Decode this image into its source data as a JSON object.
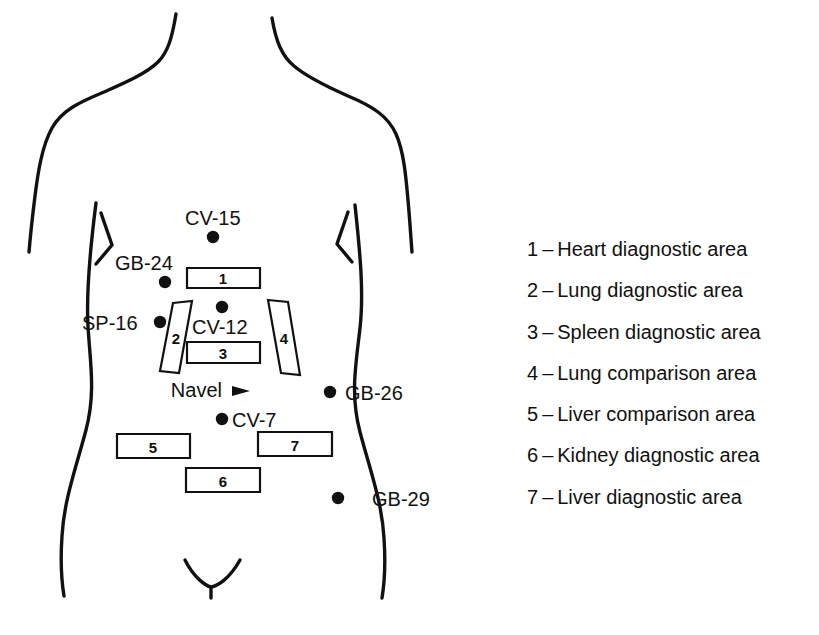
{
  "figure": {
    "line_color": "#111111",
    "background_color": "#ffffff"
  },
  "body_map": {
    "acupoints": [
      {
        "id": "cv-15",
        "label": "CV-15",
        "dot_x": 213,
        "dot_y": 237,
        "label_x": 185,
        "label_y": 225,
        "anchor": "start"
      },
      {
        "id": "gb-24",
        "label": "GB-24",
        "dot_x": 165,
        "dot_y": 282,
        "label_x": 115,
        "label_y": 270,
        "anchor": "start"
      },
      {
        "id": "sp-16",
        "label": "SP-16",
        "dot_x": 160,
        "dot_y": 322,
        "label_x": 82,
        "label_y": 330,
        "anchor": "start"
      },
      {
        "id": "cv-12",
        "label": "CV-12",
        "dot_x": 222,
        "dot_y": 307,
        "label_x": 192,
        "label_y": 334,
        "anchor": "start"
      },
      {
        "id": "gb-26",
        "label": "GB-26",
        "dot_x": 330,
        "dot_y": 392,
        "label_x": 345,
        "label_y": 400,
        "anchor": "start"
      },
      {
        "id": "cv-7",
        "label": "CV-7",
        "dot_x": 222,
        "dot_y": 419,
        "label_x": 232,
        "label_y": 427,
        "anchor": "start"
      },
      {
        "id": "gb-29",
        "label": "GB-29",
        "dot_x": 338,
        "dot_y": 498,
        "label_x": 372,
        "label_y": 506,
        "anchor": "start"
      }
    ],
    "navel": {
      "label": "Navel",
      "label_x": 222,
      "label_y": 397,
      "arrow_x": 232,
      "arrow_y": 391
    },
    "areas": [
      {
        "number": "1",
        "shape": "rect",
        "points": "187,268 260,268 260,288 187,288",
        "text_x": 223,
        "text_y": 284
      },
      {
        "number": "2",
        "shape": "parallelogram",
        "points": "173,303 192,301 179,373 160,371",
        "text_x": 176,
        "text_y": 344
      },
      {
        "number": "3",
        "shape": "rect",
        "points": "187,342 260,342 260,363 187,363",
        "text_x": 223,
        "text_y": 359
      },
      {
        "number": "4",
        "shape": "parallelogram",
        "points": "268,300 288,302 300,375 281,373",
        "text_x": 284,
        "text_y": 344
      },
      {
        "number": "5",
        "shape": "rect",
        "points": "117,434 190,434 190,458 117,458",
        "text_x": 153,
        "text_y": 453
      },
      {
        "number": "6",
        "shape": "rect",
        "points": "186,468 260,468 260,492 186,492",
        "text_x": 223,
        "text_y": 487
      },
      {
        "number": "7",
        "shape": "rect",
        "points": "258,432 332,432 332,456 258,456",
        "text_x": 295,
        "text_y": 451
      }
    ],
    "outlines": [
      {
        "id": "left-neck-shoulder-arm",
        "d": "M 176,14 C 172,38 168,52 158,62 C 146,74 122,84 104,92 C 80,102 62,110 52,128 C 42,146 38,172 35,196 C 32,220 30,240 29,252"
      },
      {
        "id": "right-neck-shoulder-arm",
        "d": "M 272,18 C 276,42 282,56 294,66 C 308,78 330,88 348,96 C 372,106 388,116 396,134 C 404,152 406,178 408,200 C 410,222 411,240 412,252"
      },
      {
        "id": "left-torso",
        "d": "M 96,203 C 90,250 86,290 88,326 C 90,362 96,392 86,430 C 76,468 64,500 62,536 C 60,566 62,584 64,596"
      },
      {
        "id": "right-torso",
        "d": "M 355,205 C 360,252 364,292 360,328 C 356,364 350,394 360,432 C 370,470 382,502 384,538 C 386,568 384,586 382,598"
      },
      {
        "id": "crotch-arc",
        "d": "M 185,560 C 194,578 206,586 211,587 C 218,586 230,578 240,560"
      },
      {
        "id": "crotch-stem",
        "d": "M 211,587 L 211,598"
      }
    ],
    "ribs": [
      {
        "id": "left-rib",
        "d": "M 101,213 L 112,245 L 96,264"
      },
      {
        "id": "right-rib",
        "d": "M 348,212 L 337,244 L 352,262"
      }
    ]
  },
  "legend": {
    "separator": "–",
    "entries": [
      {
        "key": "1",
        "label": "Heart diagnostic area"
      },
      {
        "key": "2",
        "label": "Lung diagnostic area"
      },
      {
        "key": "3",
        "label": "Spleen diagnostic area"
      },
      {
        "key": "4",
        "label": "Lung comparison area"
      },
      {
        "key": "5",
        "label": "Liver comparison area"
      },
      {
        "key": "6",
        "label": "Kidney diagnostic area"
      },
      {
        "key": "7",
        "label": "Liver diagnostic area"
      }
    ]
  }
}
